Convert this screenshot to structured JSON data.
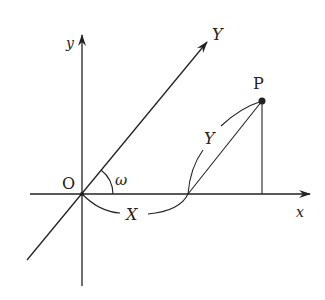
{
  "diagram": {
    "labels": {
      "origin": "O",
      "x_axis": "x",
      "y_axis": "y",
      "oblique_axis": "Y",
      "angle": "ω",
      "point": "P",
      "x_coord_arc": "X",
      "y_coord_arc": "Y"
    },
    "colors": {
      "line": "#222222",
      "background": "#ffffff"
    }
  }
}
